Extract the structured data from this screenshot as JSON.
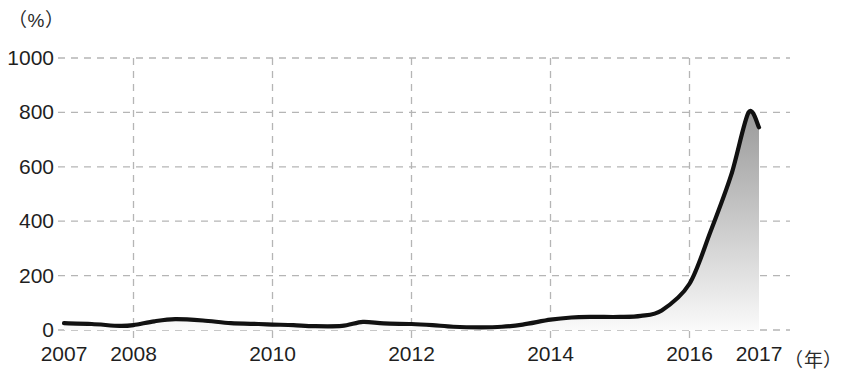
{
  "chart_data": {
    "type": "area",
    "title": "",
    "subtitle": "",
    "xlabel": "年",
    "ylabel": "%",
    "y_unit_label": "（%）",
    "x_unit_label": "（年）",
    "xlim": [
      2007,
      2017
    ],
    "ylim": [
      0,
      1000
    ],
    "ytick_values": [
      0,
      200,
      400,
      600,
      800,
      1000
    ],
    "ytick_labels": [
      "0",
      "200",
      "400",
      "600",
      "800",
      "1000"
    ],
    "xtick_values": [
      2007,
      2008,
      2010,
      2012,
      2014,
      2016,
      2017
    ],
    "xtick_labels": [
      "2007",
      "2008",
      "2010",
      "2012",
      "2014",
      "2016",
      "2017"
    ],
    "grid": true,
    "grid_style": "dashed",
    "legend": "none",
    "series": [
      {
        "name": "增长率",
        "x": [
          2007,
          2007.4,
          2007.8,
          2008.0,
          2008.3,
          2008.6,
          2009.0,
          2009.4,
          2009.8,
          2010.0,
          2010.3,
          2010.6,
          2011.0,
          2011.3,
          2011.6,
          2012.0,
          2012.3,
          2012.6,
          2013.0,
          2013.3,
          2013.6,
          2014.0,
          2014.3,
          2014.6,
          2015.0,
          2015.3,
          2015.6,
          2016.0,
          2016.3,
          2016.6,
          2016.85,
          2017.0
        ],
        "y": [
          25,
          22,
          15,
          18,
          32,
          40,
          35,
          25,
          22,
          20,
          18,
          14,
          15,
          30,
          24,
          22,
          18,
          12,
          10,
          12,
          20,
          38,
          46,
          48,
          48,
          52,
          72,
          170,
          360,
          570,
          800,
          745
        ]
      }
    ],
    "peak": {
      "x": 2016.85,
      "y": 800
    },
    "end_value": 745,
    "colors": {
      "line": "#111111",
      "fill_top": "#9a9a9a",
      "fill_bottom": "#f2f2f2",
      "grid": "#b5b5b5",
      "text": "#1f1f1f",
      "background": "#ffffff"
    }
  }
}
